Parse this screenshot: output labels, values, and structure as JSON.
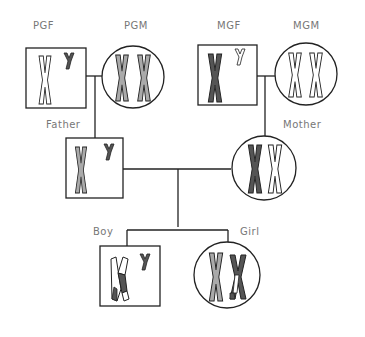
{
  "colors": {
    "line": "#222222",
    "dark": "#555555",
    "light": "#aaaaaa",
    "white": "#ffffff",
    "label": "#777777"
  },
  "individuals": {
    "pgf": {
      "label": "PGF",
      "sex": "male",
      "x_chromosome": "white",
      "y_chromosome": "dark"
    },
    "pgm": {
      "label": "PGM",
      "sex": "female",
      "x_chromosomes": [
        "light",
        "light"
      ]
    },
    "mgf": {
      "label": "MGF",
      "sex": "male",
      "x_chromosome": "dark",
      "y_chromosome": "white"
    },
    "mgm": {
      "label": "MGM",
      "sex": "female",
      "x_chromosomes": [
        "white",
        "white"
      ]
    },
    "father": {
      "label": "Father",
      "sex": "male",
      "x_chromosome": "light",
      "y_chromosome": "dark"
    },
    "mother": {
      "label": "Mother",
      "sex": "female",
      "x_chromosomes": [
        "dark",
        "white"
      ]
    },
    "boy": {
      "label": "Boy",
      "sex": "male",
      "x_chromosome": "recombinant white/dark",
      "y_chromosome": "dark"
    },
    "girl": {
      "label": "Girl",
      "sex": "female",
      "x_chromosomes": [
        "light",
        "recombinant dark/white"
      ]
    }
  }
}
